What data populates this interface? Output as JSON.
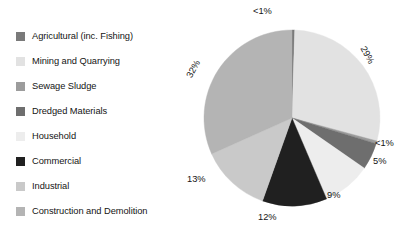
{
  "page": {
    "background": "#ffffff",
    "width": 411,
    "height": 234
  },
  "legend": {
    "items": [
      {
        "label": "Agricultural (inc. Fishing)",
        "color": "#7A7A7A"
      },
      {
        "label": "Mining and Quarrying",
        "color": "#E2E2E2"
      },
      {
        "label": "Sewage Sludge",
        "color": "#9C9C9C"
      },
      {
        "label": "Dredged Materials",
        "color": "#6E6E6E"
      },
      {
        "label": "Household",
        "color": "#EDEDED"
      },
      {
        "label": "Commercial",
        "color": "#202020"
      },
      {
        "label": "Industrial",
        "color": "#C9C9C9"
      },
      {
        "label": "Construction and Demolition",
        "color": "#B4B4B4"
      }
    ]
  },
  "chart_data": {
    "type": "pie",
    "title": "",
    "subtitle": "",
    "xlabel": "",
    "ylabel": "",
    "legend_position": "left",
    "grid": false,
    "start_angle_deg": 0,
    "direction": "clockwise",
    "categories": [
      "Agricultural (inc. Fishing)",
      "Mining and Quarrying",
      "Sewage Sludge",
      "Dredged Materials",
      "Household",
      "Commercial",
      "Industrial",
      "Construction and Demolition"
    ],
    "values": [
      0.5,
      29,
      0.5,
      5,
      9,
      12,
      13,
      32
    ],
    "labels": [
      "<1%",
      "29%",
      "<1%",
      "5%",
      "9%",
      "12%",
      "13%",
      "32%"
    ],
    "colors": [
      "#7A7A7A",
      "#E2E2E2",
      "#9C9C9C",
      "#6E6E6E",
      "#EDEDED",
      "#202020",
      "#C9C9C9",
      "#B4B4B4"
    ],
    "slices": [
      {
        "name": "Agricultural (inc. Fishing)",
        "value": 0.5,
        "label": "<1%",
        "color": "#7A7A7A"
      },
      {
        "name": "Mining and Quarrying",
        "value": 29,
        "label": "29%",
        "color": "#E2E2E2"
      },
      {
        "name": "Sewage Sludge",
        "value": 0.5,
        "label": "<1%",
        "color": "#9C9C9C"
      },
      {
        "name": "Dredged Materials",
        "value": 5,
        "label": "5%",
        "color": "#6E6E6E"
      },
      {
        "name": "Household",
        "value": 9,
        "label": "9%",
        "color": "#EDEDED"
      },
      {
        "name": "Commercial",
        "value": 12,
        "label": "12%",
        "color": "#202020"
      },
      {
        "name": "Industrial",
        "value": 13,
        "label": "13%",
        "color": "#C9C9C9"
      },
      {
        "name": "Construction and Demolition",
        "value": 32,
        "label": "32%",
        "color": "#B4B4B4"
      }
    ]
  },
  "annotations": {
    "pct_top": "<1%",
    "pct_29": "29%",
    "pct_lt1_right": "<1%",
    "pct_5": "5%",
    "pct_9": "9%",
    "pct_12": "12%",
    "pct_13": "13%",
    "pct_32": "32%"
  }
}
